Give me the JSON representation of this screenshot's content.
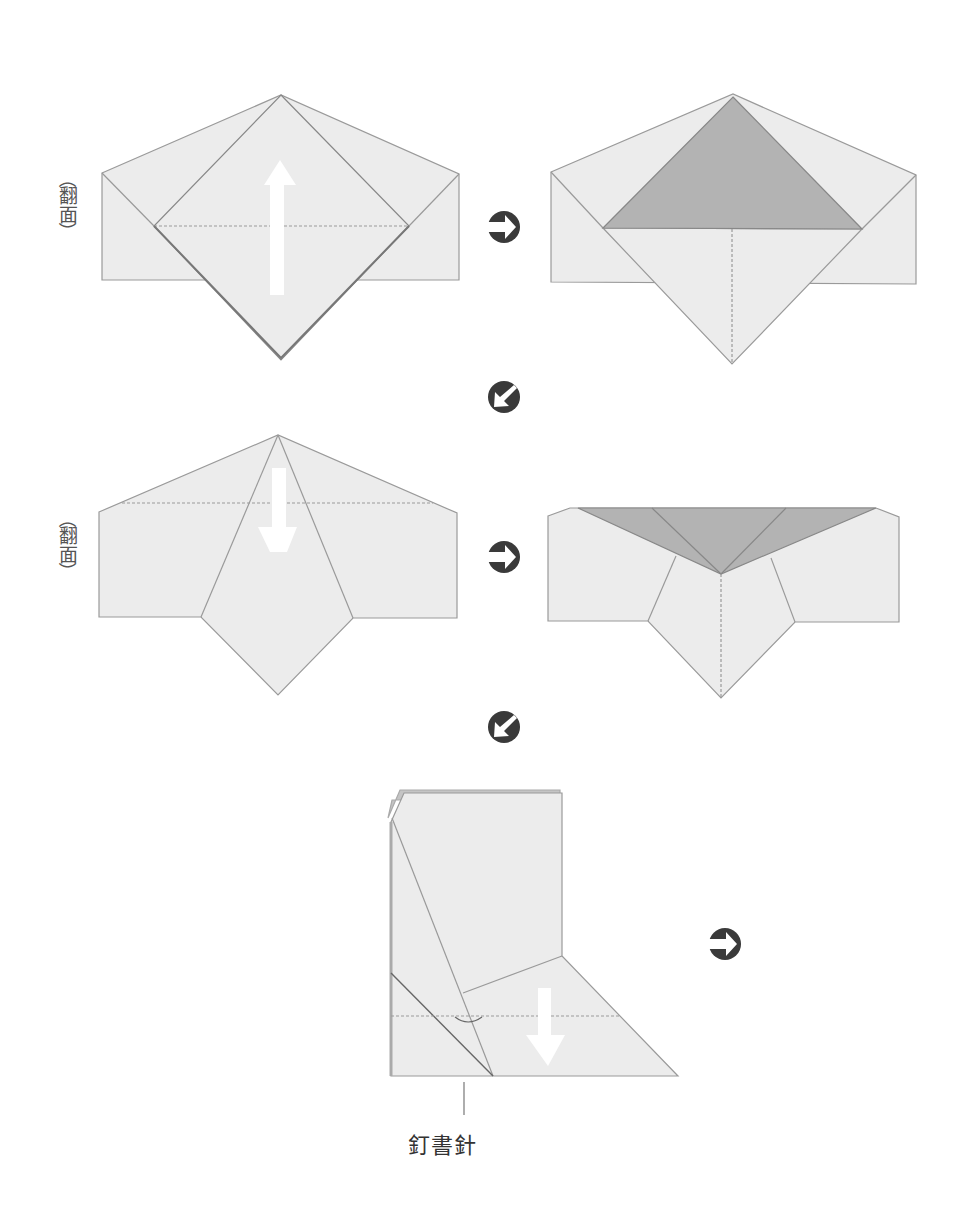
{
  "labels": {
    "flip_1": "翻面",
    "flip_2": "翻面",
    "paren_open": "（",
    "paren_close": "）",
    "staple": "釘書針"
  },
  "icons": {
    "next_right_1": "arrow-right-circle",
    "next_diag_1": "arrow-down-left-circle",
    "next_right_2": "arrow-right-circle",
    "next_diag_2": "arrow-down-left-circle",
    "next_right_3": "arrow-right-circle"
  },
  "colors": {
    "paper": "#ececec",
    "paper_line": "#9a9a9a",
    "shaded": "#b3b3b3",
    "icon": "#3a3a3a",
    "fold_arrow": "#ffffff"
  },
  "steps": [
    {
      "id": 1,
      "label": "flip-over",
      "fold_arrow": "up"
    },
    {
      "id": 2,
      "label": "",
      "fold_arrow": "none"
    },
    {
      "id": 3,
      "label": "flip-over",
      "fold_arrow": "down"
    },
    {
      "id": 4,
      "label": "",
      "fold_arrow": "none"
    },
    {
      "id": 5,
      "label": "staple",
      "fold_arrow": "down"
    }
  ]
}
